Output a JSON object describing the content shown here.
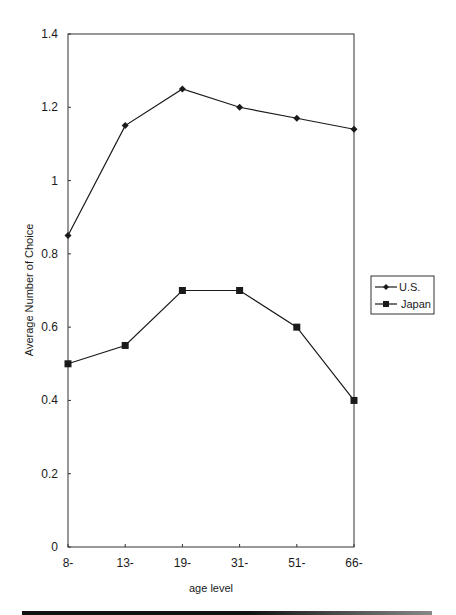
{
  "chart_data": {
    "type": "line",
    "title": "",
    "xlabel": "age level",
    "ylabel": "Average Number of Choice",
    "categories": [
      "8-",
      "13-",
      "19-",
      "31-",
      "51-",
      "66-"
    ],
    "series": [
      {
        "name": "U.S.",
        "marker": "diamond",
        "values": [
          0.85,
          1.15,
          1.25,
          1.2,
          1.17,
          1.14
        ]
      },
      {
        "name": "Japan",
        "marker": "square",
        "values": [
          0.5,
          0.55,
          0.7,
          0.7,
          0.6,
          0.4
        ]
      }
    ],
    "ylim": [
      0,
      1.4
    ],
    "yticks": [
      "0",
      "0.2",
      "0.4",
      "0.6",
      "0.8",
      "1",
      "1.2",
      "1.4"
    ],
    "grid": false,
    "legend_position": "right"
  },
  "colors": {
    "line": "#1a1a1a",
    "background": "#ffffff"
  }
}
